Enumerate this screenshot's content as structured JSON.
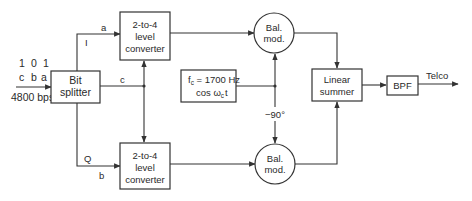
{
  "input": {
    "bits": [
      "1",
      "0",
      "1"
    ],
    "bit_names": [
      "c",
      "b",
      "a"
    ],
    "rate": "4800 bps"
  },
  "blocks": {
    "bit_splitter": [
      "Bit",
      "splitter"
    ],
    "converter_top": [
      "2-to-4",
      "level",
      "converter"
    ],
    "converter_bottom": [
      "2-to-4",
      "level",
      "converter"
    ],
    "oscillator": {
      "line1_main": "f",
      "line1_sub": "c",
      "line1_rest": " = 1700 Hz",
      "line2_main": "cos ω",
      "line2_sub": "c",
      "line2_rest": "t"
    },
    "balmod_top": [
      "Bal.",
      "mod."
    ],
    "balmod_bottom": [
      "Bal.",
      "mod."
    ],
    "summer": [
      "Linear",
      "summer"
    ],
    "bpf": "BPF"
  },
  "signals": {
    "i_channel": "I",
    "i_bit": "a",
    "c_bit": "c",
    "q_channel": "Q",
    "q_bit": "b",
    "phase_shift": "−90°",
    "output": "Telco"
  }
}
